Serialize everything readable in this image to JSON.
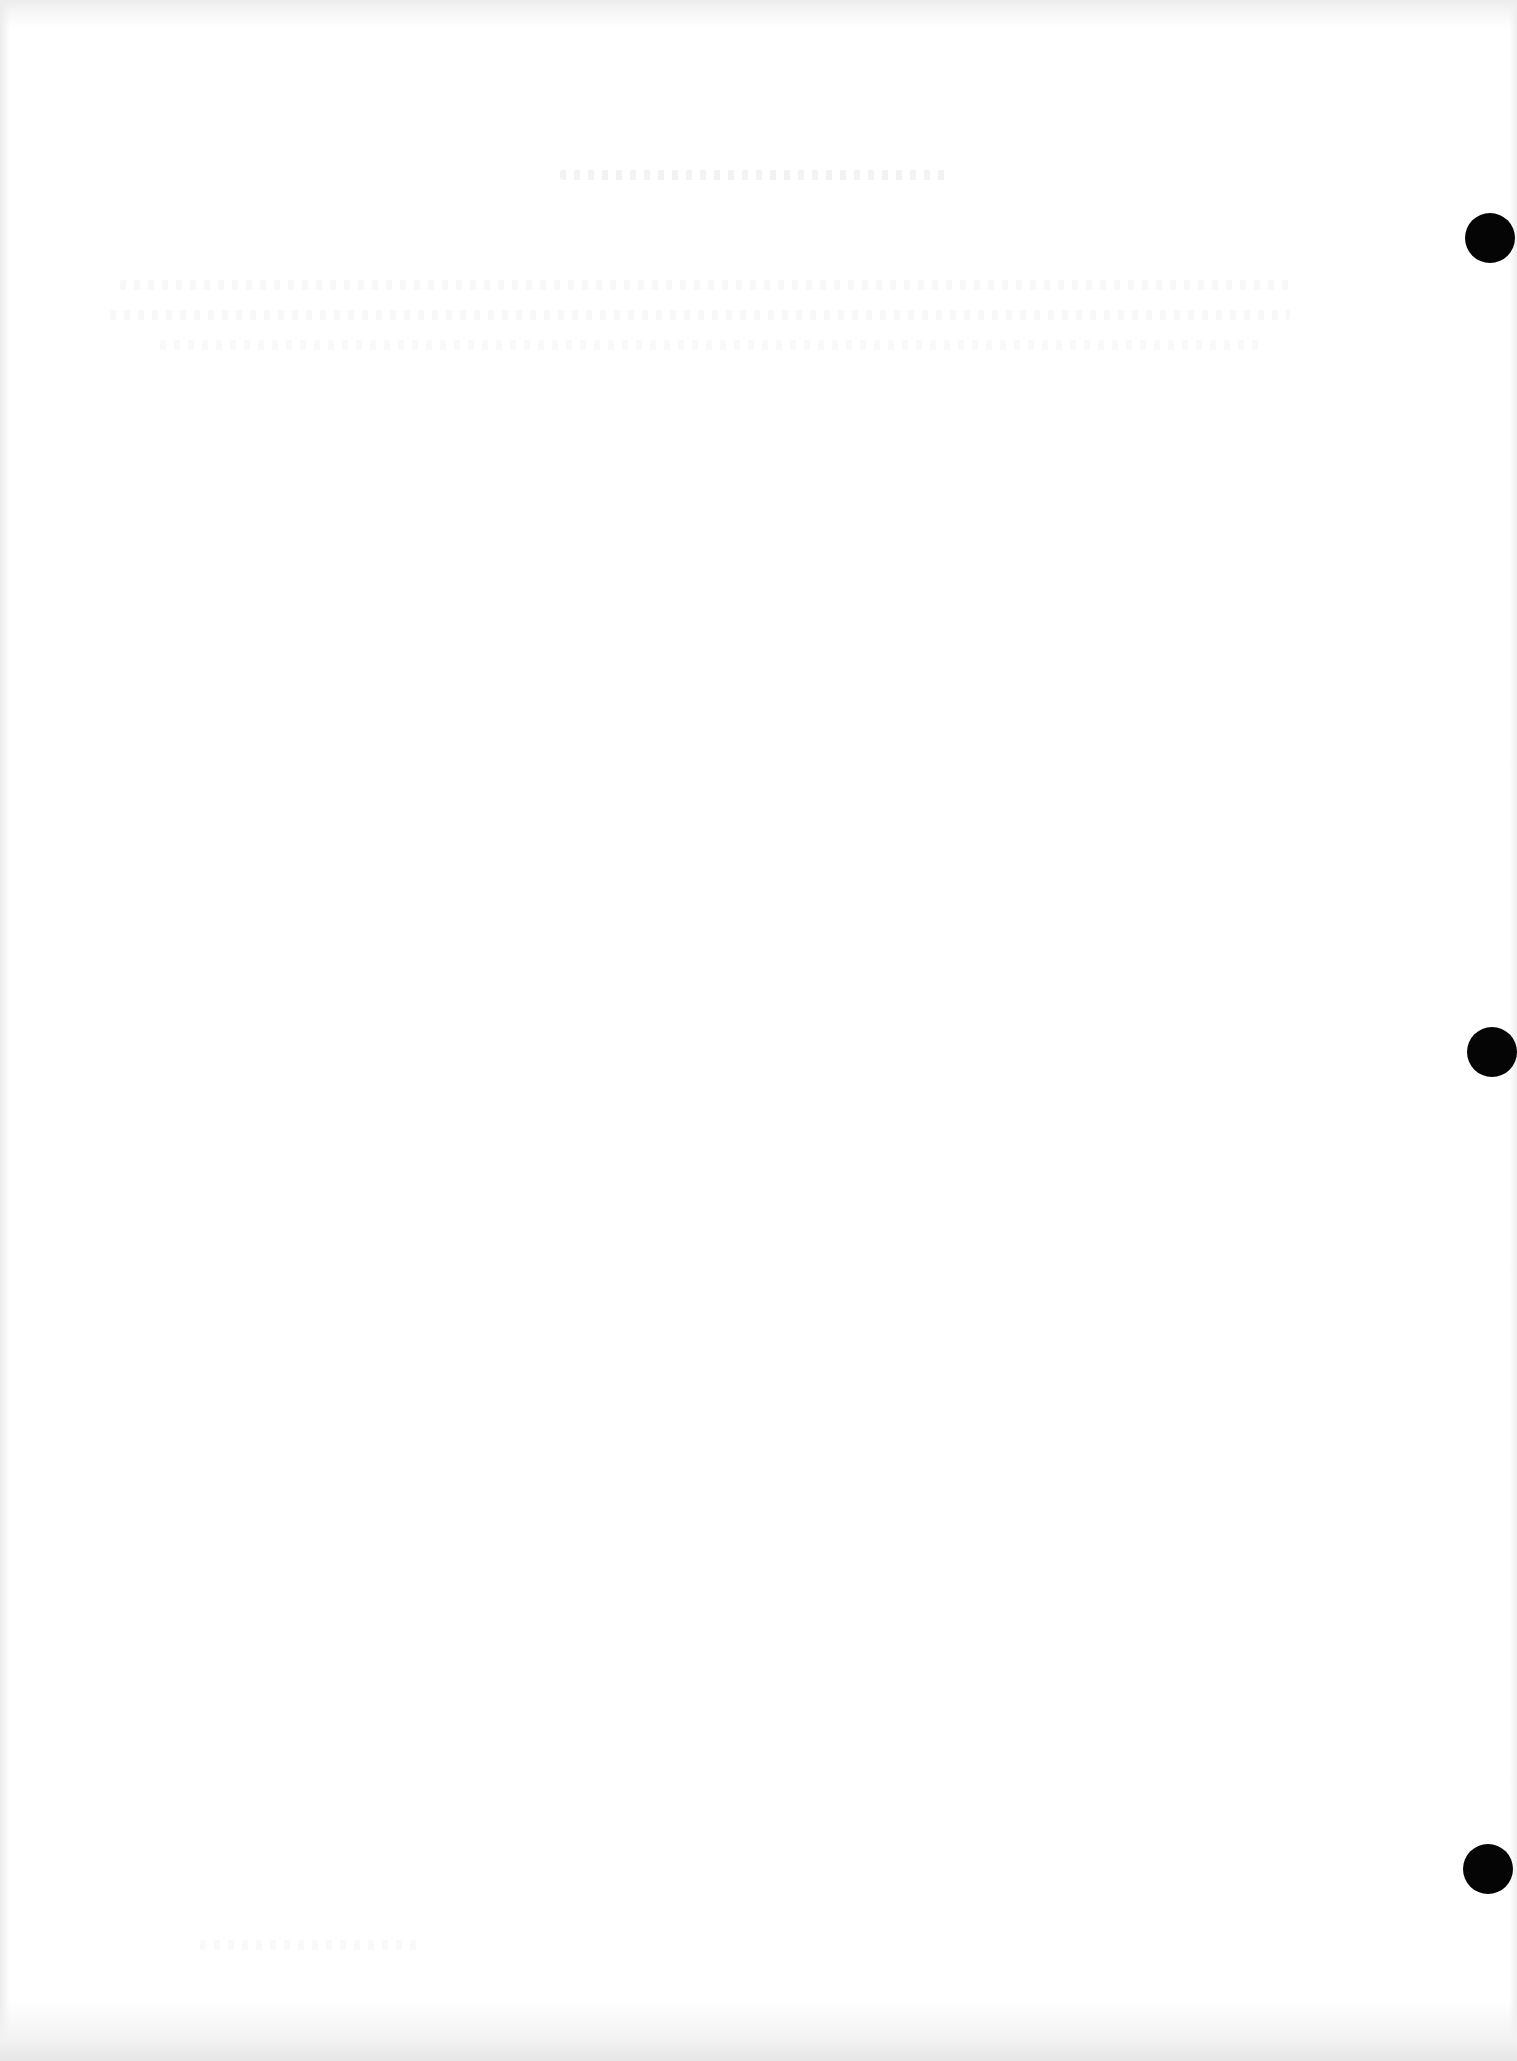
{
  "document": {
    "type": "blank scanned page",
    "background_color": "#ffffff",
    "edge_shade_color": "#e6e6e6",
    "legible_text": []
  },
  "punch_holes": {
    "color": "#050505",
    "items": [
      {
        "cx": 1490,
        "cy": 238,
        "r": 25
      },
      {
        "cx": 1492,
        "cy": 1052,
        "r": 25
      },
      {
        "cx": 1488,
        "cy": 1869,
        "r": 25
      }
    ]
  }
}
